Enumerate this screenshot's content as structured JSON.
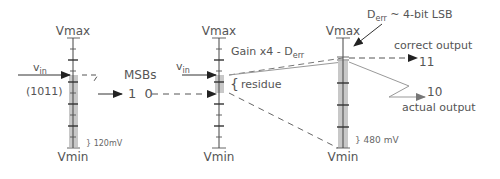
{
  "diagram": {
    "colors": {
      "line": "#444444",
      "shade": "#c8c8c8",
      "text": "#555555",
      "solid_grey": "#999999"
    },
    "stage1": {
      "vmax_label": "Vmax",
      "vmin_label": "Vmin",
      "vin_label": "v",
      "vin_sub": "in",
      "code_label": "(1011)",
      "lsb_label": "120mV"
    },
    "transfer": {
      "msbs_label": "MSBs",
      "msbs_value": "1 0"
    },
    "stage2": {
      "vmax_label": "Vmax",
      "vmin_label": "Vmin",
      "vin_label": "v",
      "vin_sub": "in",
      "residue_label": "residue",
      "gain_label": "Gain x4 - D",
      "gain_sub": "err"
    },
    "stage3": {
      "vmax_label": "Vmax",
      "vmin_label": "Vmin",
      "lsb_label": "480 mV",
      "derr_label": "D",
      "derr_sub": "err",
      "derr_text": " ~ 4-bit LSB",
      "correct_label": "correct output",
      "correct_value": "11",
      "actual_value": "10",
      "actual_label": "actual output"
    }
  }
}
